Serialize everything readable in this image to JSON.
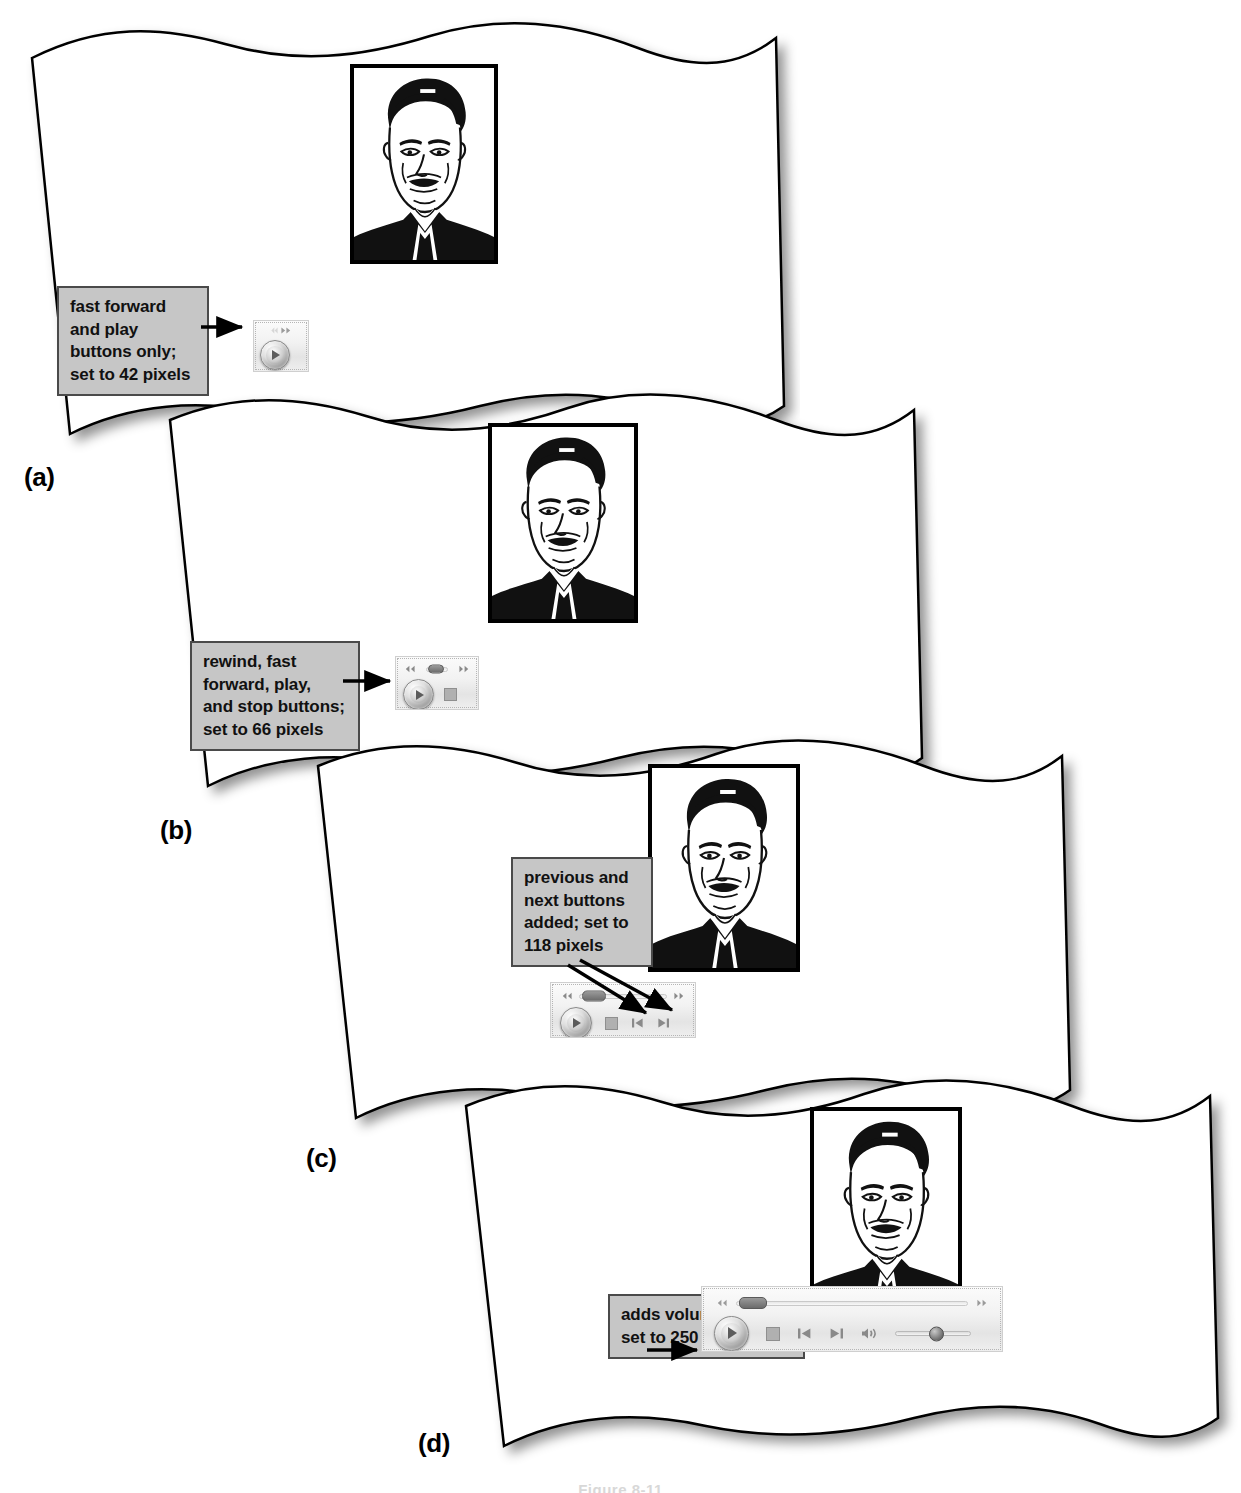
{
  "figure": {
    "bottom_caption": "Figure 8-11"
  },
  "panels": [
    {
      "id": "a",
      "label": "(a)",
      "callout": {
        "lines": [
          "fast forward",
          "and play",
          "buttons only;",
          "set to 42 pixels"
        ],
        "text": "fast forward and play buttons only; set to 42 pixels"
      },
      "player": {
        "width_px": 42,
        "controls": [
          "fast-forward",
          "play"
        ]
      },
      "portrait_alt": "line-art portrait of a man in a suit"
    },
    {
      "id": "b",
      "label": "(b)",
      "callout": {
        "lines": [
          "rewind, fast",
          "forward, play,",
          "and stop buttons;",
          "set to 66 pixels"
        ],
        "text": "rewind, fast forward, play, and stop buttons; set to 66 pixels"
      },
      "player": {
        "width_px": 66,
        "controls": [
          "rewind",
          "fast-forward",
          "play",
          "stop"
        ]
      },
      "portrait_alt": "line-art portrait of a man in a suit"
    },
    {
      "id": "c",
      "label": "(c)",
      "callout": {
        "lines": [
          "previous and",
          "next buttons",
          "added; set to",
          "118 pixels"
        ],
        "text": "previous and next buttons added; set to 118 pixels"
      },
      "player": {
        "width_px": 118,
        "controls": [
          "rewind",
          "fast-forward",
          "play",
          "stop",
          "previous",
          "next"
        ]
      },
      "portrait_alt": "line-art portrait of a man in a suit"
    },
    {
      "id": "d",
      "label": "(d)",
      "callout": {
        "lines": [
          "adds volume control;",
          "set to 250 pixels"
        ],
        "text": "adds volume control; set to 250 pixels"
      },
      "player": {
        "width_px": 250,
        "controls": [
          "rewind",
          "fast-forward",
          "play",
          "stop",
          "previous",
          "next",
          "mute",
          "volume-slider"
        ]
      },
      "portrait_alt": "line-art portrait of a man in a suit"
    }
  ],
  "colors": {
    "callout_fill": "#c6c6c6",
    "callout_border": "#4a4a4a",
    "page_fill": "#ffffff",
    "page_border": "#000000",
    "arrow": "#000000",
    "portrait_ink": "#000000"
  }
}
